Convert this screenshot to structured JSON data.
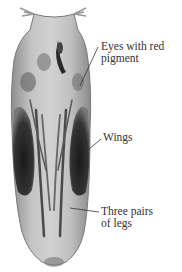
{
  "figure": {
    "labels": [
      {
        "id": "eyes",
        "line1": "Eyes with red",
        "line2": "pigment"
      },
      {
        "id": "wings",
        "line1": "Wings"
      },
      {
        "id": "legs",
        "line1": "Three pairs",
        "line2": "of legs"
      }
    ]
  },
  "colors": {
    "background": "#ffffff",
    "body": "#b8b8b8",
    "dark": "#2a2a2a",
    "text": "#333333"
  }
}
